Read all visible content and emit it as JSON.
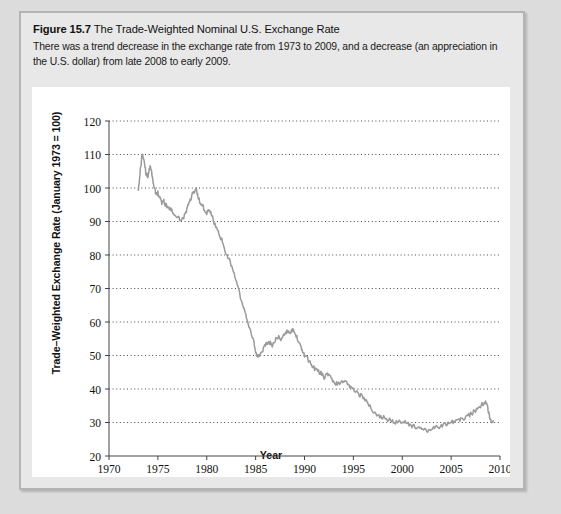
{
  "figure": {
    "number_label": "Figure 15.7",
    "title": "The Trade-Weighted Nominal U.S. Exchange Rate",
    "description": "There was a trend decrease in the exchange rate from 1973 to 2009, and a decrease (an appreciation in the U.S. dollar) from late 2008 to early 2009."
  },
  "chart_data": {
    "type": "line",
    "title": "The Trade-Weighted Nominal U.S. Exchange Rate",
    "xlabel": "Year",
    "ylabel": "Trade–Weighted Exchange Rate (January 1973 = 100)",
    "xlim": [
      1970,
      2010
    ],
    "ylim": [
      20,
      120
    ],
    "xticks": [
      1970,
      1975,
      1980,
      1985,
      1990,
      1995,
      2000,
      2005,
      2010
    ],
    "xtick_labels": [
      "1970",
      "1975",
      "1980",
      "1985",
      "1990",
      "1995",
      "2000",
      "2005",
      "2010"
    ],
    "yticks": [
      20,
      30,
      40,
      50,
      60,
      70,
      80,
      90,
      100,
      110,
      120
    ],
    "ytick_labels": [
      "20",
      "30",
      "40",
      "50",
      "60",
      "70",
      "80",
      "90",
      "100",
      "110",
      "120"
    ],
    "grid": "horizontal-dotted",
    "legend": "none",
    "line_color": "#9a9a9a",
    "series": [
      {
        "name": "Trade-Weighted Nominal U.S. Exchange Rate",
        "x": [
          1973.0,
          1973.2,
          1973.4,
          1973.6,
          1973.8,
          1974.0,
          1974.2,
          1974.4,
          1974.6,
          1974.8,
          1975.0,
          1975.2,
          1975.4,
          1975.6,
          1975.8,
          1976.0,
          1976.3,
          1976.6,
          1977.0,
          1977.4,
          1977.8,
          1978.0,
          1978.3,
          1978.6,
          1978.9,
          1979.1,
          1979.4,
          1979.7,
          1980.0,
          1980.3,
          1980.6,
          1981.0,
          1981.3,
          1981.6,
          1982.0,
          1982.4,
          1982.8,
          1983.2,
          1983.6,
          1984.0,
          1984.4,
          1984.8,
          1985.0,
          1985.2,
          1985.5,
          1985.8,
          1986.1,
          1986.4,
          1986.7,
          1987.0,
          1987.3,
          1987.6,
          1987.9,
          1988.2,
          1988.5,
          1988.8,
          1989.1,
          1989.4,
          1989.7,
          1990.0,
          1990.4,
          1990.8,
          1991.2,
          1991.6,
          1992.0,
          1992.4,
          1992.8,
          1993.2,
          1993.6,
          1994.0,
          1994.4,
          1994.8,
          1995.2,
          1995.6,
          1996.0,
          1996.5,
          1997.0,
          1997.5,
          1998.0,
          1998.5,
          1999.0,
          1999.5,
          2000.0,
          2000.5,
          2001.0,
          2001.5,
          2002.0,
          2002.5,
          2003.0,
          2003.5,
          2004.0,
          2004.5,
          2005.0,
          2005.5,
          2006.0,
          2006.5,
          2007.0,
          2007.5,
          2008.0,
          2008.4,
          2008.7,
          2008.9,
          2009.1,
          2009.3
        ],
        "values": [
          100,
          105,
          110.5,
          108,
          104,
          103.5,
          106.5,
          104,
          100.5,
          98.5,
          98.5,
          97,
          95.5,
          96,
          95,
          94.5,
          93.5,
          92.5,
          91,
          90.5,
          92,
          94,
          96.5,
          98.5,
          100,
          97.5,
          95,
          94,
          92.5,
          93.5,
          91,
          88,
          86,
          84,
          80.5,
          78,
          74,
          70,
          66,
          62,
          58,
          54,
          51,
          50,
          50.5,
          52,
          53.5,
          54,
          53,
          54.5,
          55.5,
          55,
          56,
          57.5,
          57,
          57.5,
          56,
          54.5,
          52,
          50,
          48.5,
          47,
          45.5,
          45,
          43.5,
          44.5,
          43,
          41.5,
          41.5,
          42.5,
          41.5,
          40.5,
          39.5,
          38.5,
          37.5,
          35.5,
          33.5,
          32,
          31.5,
          31,
          30.5,
          30,
          30.5,
          30,
          29,
          28.5,
          28,
          27.5,
          28,
          28.5,
          29,
          29.5,
          30,
          30.5,
          31,
          31.5,
          32.5,
          33.5,
          35,
          36,
          35.5,
          32,
          30.5,
          30.5
        ]
      }
    ]
  }
}
